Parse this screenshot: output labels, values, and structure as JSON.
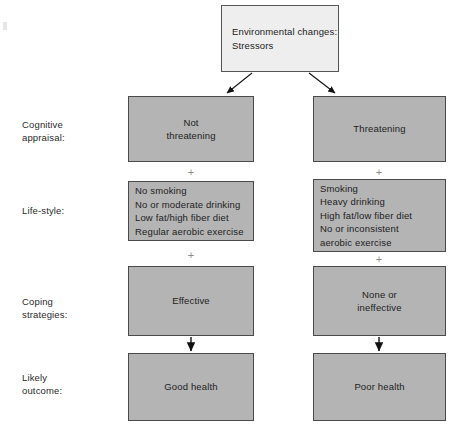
{
  "diagram": {
    "colors": {
      "box_fill": "#b4b4b4",
      "top_box_fill": "#eeeeee",
      "box_border": "#4a4a4a",
      "text": "#222222",
      "plus_symbol": "#8a8a8a",
      "background": "#ffffff"
    },
    "top_node": {
      "label": "Environmental changes:\nStressors"
    },
    "row_labels": [
      {
        "name": "cognitive-appraisal",
        "label": "Cognitive\nappraisal:"
      },
      {
        "name": "life-style",
        "label": "Life-style:"
      },
      {
        "name": "coping-strategies",
        "label": "Coping\nstrategies:"
      },
      {
        "name": "likely-outcome",
        "label": "Likely\noutcome:"
      }
    ],
    "left_branch": {
      "cognitive_appraisal": "Not\nthreatening",
      "life_style": "No smoking\nNo or moderate drinking\nLow fat/high fiber diet\nRegular aerobic exercise",
      "coping_strategies": "Effective",
      "likely_outcome": "Good health"
    },
    "right_branch": {
      "cognitive_appraisal": "Threatening",
      "life_style": "Smoking\nHeavy drinking\nHigh fat/low fiber diet\nNo or inconsistent\naerobic exercise",
      "coping_strategies": "None or\nineffective",
      "likely_outcome": "Poor health"
    },
    "connectors": {
      "plus_symbol": "+",
      "plus_count": 4,
      "arrow_count": 4
    }
  }
}
